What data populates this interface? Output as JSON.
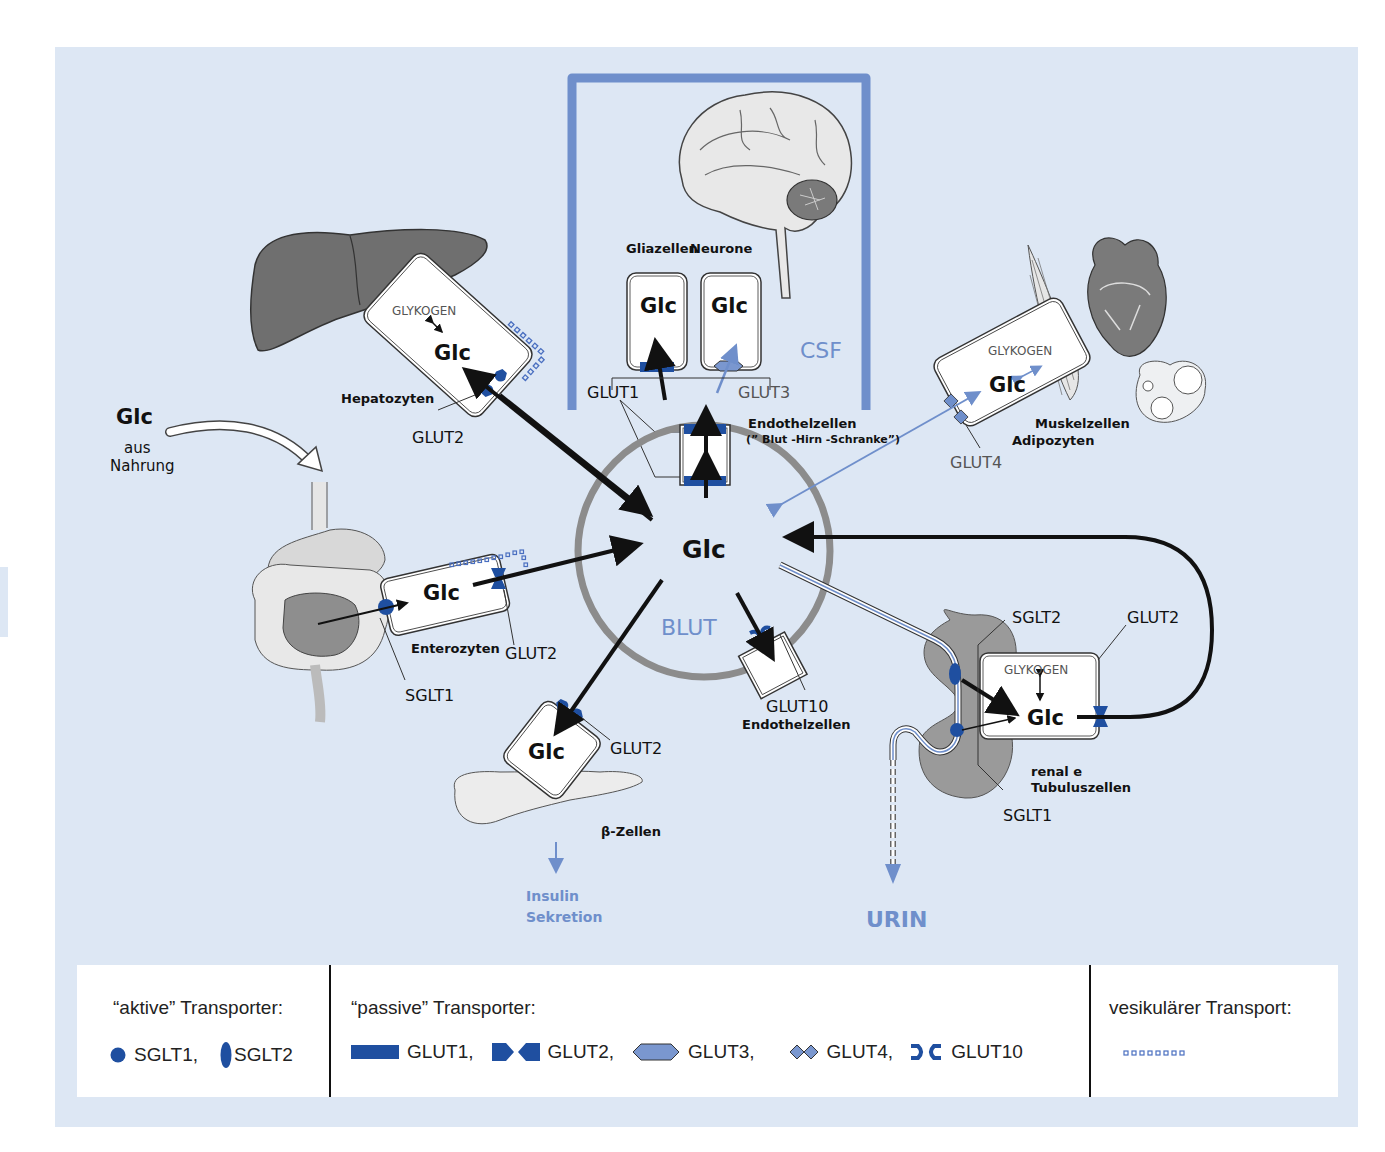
{
  "diagram": {
    "title_implied": "Glucose transport in the body",
    "colors": {
      "panel_bg": "#dde7f4",
      "transporter_blue": "#1f4fa0",
      "light_blue_accent": "#6f8fcb",
      "organ_gray": "#777777",
      "circle_gray": "#8c8c8c"
    },
    "center": {
      "glc_label": "Glc",
      "compartment_label": "BLUT"
    },
    "brain": {
      "compartment_label": "CSF",
      "glia_label": "Gliazellen",
      "neuron_label": "Neurone",
      "glia_glc": "Glc",
      "neuron_glc": "Glc",
      "glut1_label": "GLUT1",
      "glut3_label": "GLUT3",
      "endothel_label": "Endothelzellen",
      "bbb_label": "(” Blut -Hirn -Schranke”)"
    },
    "liver": {
      "cell_label": "Hepatozyten",
      "glycogen_label": "GLYKOGEN",
      "glc_label": "Glc",
      "transporter_label": "GLUT2"
    },
    "food": {
      "glc_label": "Glc",
      "source_line1": "aus",
      "source_line2": "Nahrung"
    },
    "intestine": {
      "cell_label": "Enterozyten",
      "glc_label": "Glc",
      "apical_transporter": "SGLT1",
      "basal_transporter": "GLUT2"
    },
    "pancreas": {
      "cell_label": "β-Zellen",
      "glc_label": "Glc",
      "transporter_label": "GLUT2",
      "output_line1": "Insulin",
      "output_line2": "Sekretion"
    },
    "endothelium": {
      "transporter_label": "GLUT10",
      "cell_label": "Endothelzellen"
    },
    "muscle_fat": {
      "glycogen_label": "GLYKOGEN",
      "glc_label": "Glc",
      "cell_label_1": "Muskelzellen",
      "cell_label_2": "Adipozyten",
      "transporter_label": "GLUT4"
    },
    "kidney": {
      "glycogen_label": "GLYKOGEN",
      "glc_label": "Glc",
      "sglt2_label": "SGLT2",
      "sglt1_label": "SGLT1",
      "glut2_label": "GLUT2",
      "cell_label_1": "renal e",
      "cell_label_2": "Tubuluszellen",
      "output_label": "URIN"
    }
  },
  "legend": {
    "active": {
      "title": "“aktive” Transporter:",
      "items": [
        {
          "icon": "circle-icon",
          "label": "SGLT1,"
        },
        {
          "icon": "ellipse-icon",
          "label": "SGLT2"
        }
      ]
    },
    "passive": {
      "title": "“passive” Transporter:",
      "items": [
        {
          "icon": "rectangle-icon",
          "label": "GLUT1,"
        },
        {
          "icon": "bowtie-icon",
          "label": "GLUT2,"
        },
        {
          "icon": "hexagon-icon",
          "label": "GLUT3,"
        },
        {
          "icon": "double-diamond-icon",
          "label": "GLUT4,"
        },
        {
          "icon": "bracket-pair-icon",
          "label": "GLUT10"
        }
      ]
    },
    "vesicular": {
      "title": "vesikulärer Transport:",
      "icon": "dotted-squares-icon"
    }
  }
}
